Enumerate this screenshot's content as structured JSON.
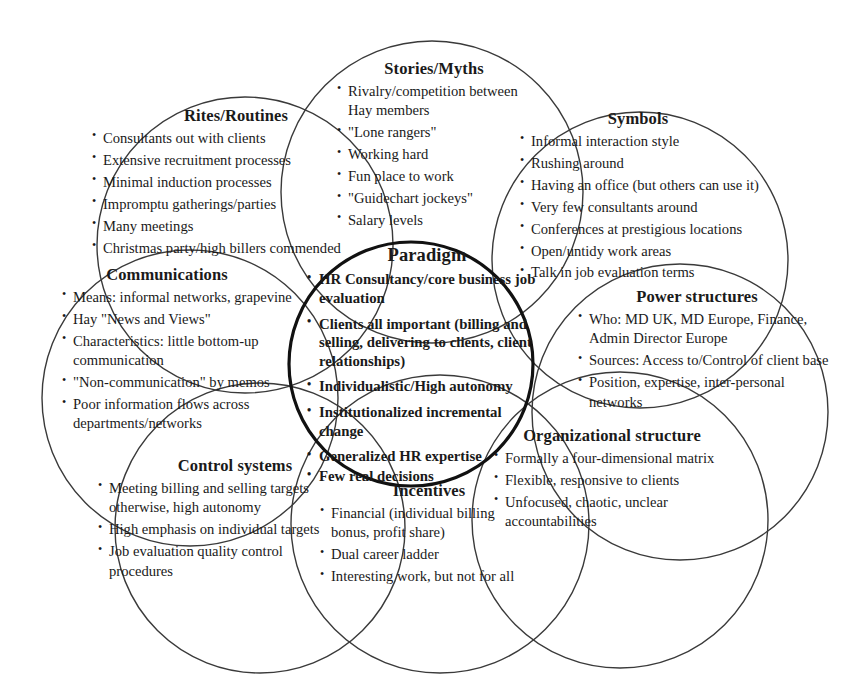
{
  "diagram": {
    "stroke_color": "#3a3a3a",
    "paradigm_stroke_color": "#111111",
    "background": "#ffffff"
  },
  "paradigm": {
    "title": "Paradigm",
    "items": [
      "HR Consultancy/core business job evaluation",
      "Clients all important (billing and selling, delivering to clients, client relationships)",
      "Individualistic/High autonomy",
      "Institutionalized incremental change",
      "Generalized HR expertise",
      "Few real decisions"
    ]
  },
  "sections": {
    "rites": {
      "title": "Rites/Routines",
      "items": [
        "Consultants out with clients",
        "Extensive recruitment processes",
        "Minimal induction processes",
        "Impromptu gatherings/parties",
        "Many meetings",
        "Christmas party/high billers commended"
      ]
    },
    "stories": {
      "title": "Stories/Myths",
      "items": [
        "Rivalry/competition between Hay members",
        "\"Lone rangers\"",
        "Working hard",
        "Fun place to work",
        "\"Guidechart jockeys\"",
        "Salary levels"
      ]
    },
    "symbols": {
      "title": "Symbols",
      "items": [
        "Informal interaction style",
        "Rushing around",
        "Having an office (but others can use it)",
        "Very few consultants around",
        "Conferences at prestigious locations",
        "Open/untidy work areas",
        "Talk in job evaluation terms"
      ]
    },
    "communications": {
      "title": "Communications",
      "items": [
        "Means: informal networks, grapevine",
        "Hay \"News and Views\"",
        "Characteristics: little bottom-up communication",
        "\"Non-communication\" by memos",
        "Poor information flows across departments/networks"
      ]
    },
    "power": {
      "title": "Power structures",
      "items": [
        "Who: MD UK, MD Europe, Finance,  Admin Director Europe",
        "Sources: Access to/Control of client base",
        "Position, expertise, inter-personal networks"
      ]
    },
    "organizational": {
      "title": "Organizational structure",
      "items": [
        "Formally a four-dimensional matrix",
        "Flexible, responsive to clients",
        "Unfocused, chaotic, unclear accountabilities"
      ]
    },
    "control": {
      "title": "Control systems",
      "items": [
        "Meeting billing and selling targets otherwise, high autonomy",
        "High emphasis on individual targets",
        "Job evaluation quality control procedures"
      ]
    },
    "incentives": {
      "title": "Incentives",
      "items": [
        "Financial (individual billing bonus, profit share)",
        "Dual career ladder",
        "Interesting work, but not for all"
      ]
    }
  }
}
